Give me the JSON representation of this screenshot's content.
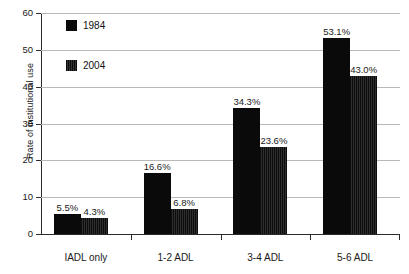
{
  "chart_data": {
    "type": "bar",
    "title": "",
    "subtitle": "",
    "xlabel": "",
    "ylabel": "Rate of institutional use",
    "ylim": [
      0,
      60
    ],
    "ytick_values": [
      0,
      10,
      20,
      30,
      40,
      50,
      60
    ],
    "ytick_labels": [
      "0",
      "10",
      "20",
      "30",
      "40",
      "50",
      "60"
    ],
    "grid": true,
    "grid_axis": "y",
    "legend_position": "upper-left-inside",
    "categories": [
      "IADL only",
      "1-2 ADL",
      "3-4 ADL",
      "5-6 ADL"
    ],
    "series": [
      {
        "name": "1984",
        "color": "#0a0a0a",
        "values": [
          5.5,
          16.6,
          34.3,
          53.1
        ],
        "data_labels": [
          "5.5%",
          "16.6%",
          "34.3%",
          "53.1%"
        ]
      },
      {
        "name": "2004",
        "color": "#2e2e2e",
        "values": [
          4.3,
          6.8,
          23.6,
          43.0
        ],
        "data_labels": [
          "4.3%",
          "6.8%",
          "23.6%",
          "43.0%"
        ]
      }
    ]
  },
  "legend": {
    "entries": [
      {
        "label": "1984",
        "swatch": "legend-swatch-1984"
      },
      {
        "label": "2004",
        "swatch": "legend-swatch-2004"
      }
    ]
  },
  "axes": {
    "y_title": "Rate of institutional use"
  }
}
